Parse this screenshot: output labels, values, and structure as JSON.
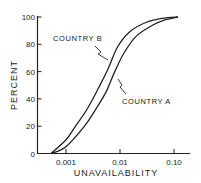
{
  "chart_data": {
    "type": "line",
    "title": "",
    "xlabel": "UNAVAILABILITY",
    "ylabel": "PERCENT",
    "x_scale": "log",
    "xlim": [
      0.0004,
      0.2
    ],
    "ylim": [
      0,
      100
    ],
    "x_ticks": [
      0.001,
      0.01,
      0.1
    ],
    "x_tick_labels": [
      "0.001",
      "0.01",
      "0.10"
    ],
    "y_ticks": [
      0,
      20,
      40,
      60,
      80,
      100
    ],
    "y_tick_labels": [
      "0",
      "20",
      "40",
      "60",
      "80",
      "100"
    ],
    "grid": false,
    "legend": "inline labels with zigzag leader lines",
    "series": [
      {
        "name": "COUNTRY B",
        "x": [
          0.00053,
          0.001,
          0.0015,
          0.0025,
          0.004,
          0.006,
          0.009,
          0.015,
          0.03,
          0.06,
          0.118
        ],
        "y": [
          0,
          10,
          20,
          33,
          48,
          62,
          78,
          89,
          96,
          99,
          100
        ]
      },
      {
        "name": "COUNTRY A",
        "x": [
          0.00053,
          0.001,
          0.0022,
          0.0035,
          0.0055,
          0.008,
          0.012,
          0.02,
          0.04,
          0.07,
          0.118
        ],
        "y": [
          0,
          5,
          20,
          32,
          45,
          60,
          74,
          86,
          94,
          98,
          100
        ]
      }
    ],
    "annotations": [
      {
        "text": "COUNTRY B",
        "points_to": "COUNTRY B curve near 80%"
      },
      {
        "text": "COUNTRY A",
        "points_to": "COUNTRY A curve near 55%"
      }
    ]
  },
  "labels": {
    "series_b": "COUNTRY B",
    "series_a": "COUNTRY A",
    "xlabel": "UNAVAILABILITY",
    "ylabel": "PERCENT"
  },
  "style": {
    "line_color": "#222222",
    "background": "#ffffff"
  }
}
